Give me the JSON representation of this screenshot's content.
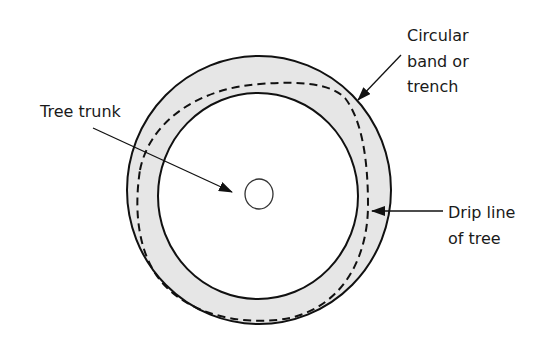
{
  "diagram": {
    "labels": {
      "trunk": "Tree trunk",
      "band_line1": "Circular",
      "band_line2": "band or",
      "band_line3": "trench",
      "drip_line1": "Drip line",
      "drip_line2": "of tree"
    },
    "colors": {
      "band_fill": "#e6e6e6",
      "stroke": "#111111",
      "background": "#ffffff"
    }
  }
}
